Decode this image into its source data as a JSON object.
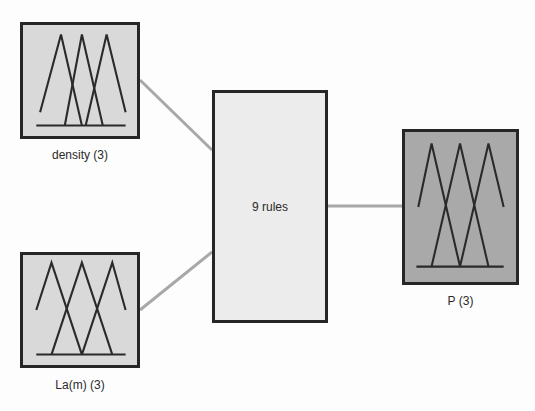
{
  "diagram": {
    "type": "fuzzy-inference-system",
    "inputs": [
      {
        "name": "density",
        "mf_count": 3,
        "label": "density (3)"
      },
      {
        "name": "La(m)",
        "mf_count": 3,
        "label": "La(m) (3)"
      }
    ],
    "rule_block": {
      "label": "9 rules",
      "rule_count": 9
    },
    "outputs": [
      {
        "name": "P",
        "mf_count": 3,
        "label": "P (3)"
      }
    ],
    "colors": {
      "input_fill": "#d9d9d9",
      "rule_fill": "#ececec",
      "output_fill": "#a9a9a9",
      "border": "#262626",
      "connector": "#a8a8a8"
    }
  }
}
